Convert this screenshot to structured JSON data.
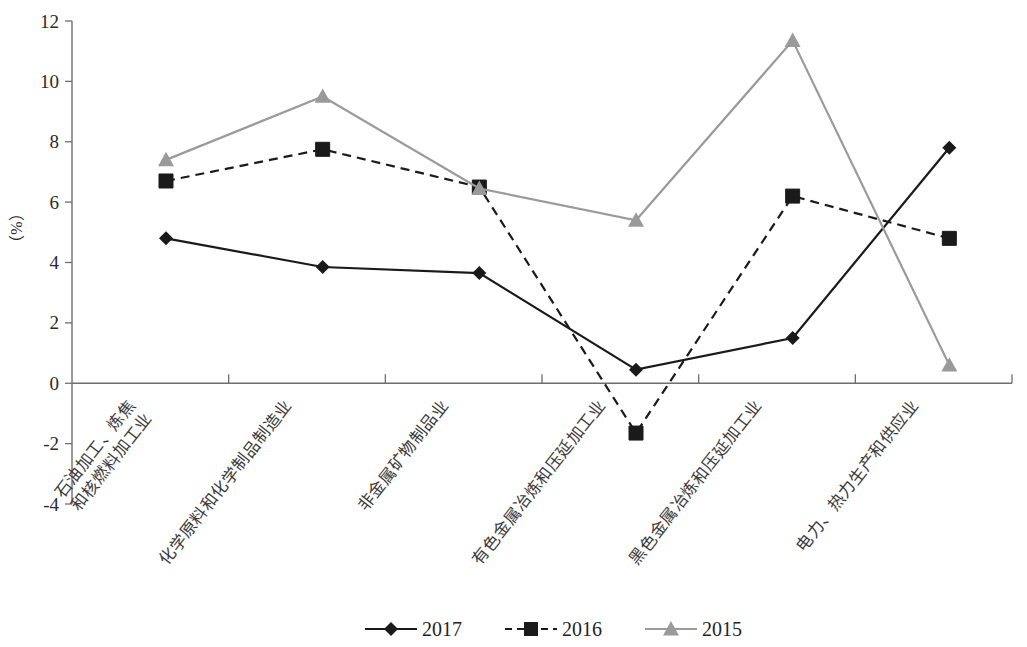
{
  "chart_data": {
    "type": "line",
    "title": "",
    "xlabel": "",
    "ylabel": "（%）",
    "ylim": [
      -4,
      12
    ],
    "ytick_step": 2,
    "yticks": [
      "12",
      "10",
      "8",
      "6",
      "4",
      "2",
      "0",
      "-2",
      "-4"
    ],
    "grid": false,
    "legend_position": "bottom",
    "categories": [
      "石油加工、炼焦\n和核燃料加工业",
      "化学原料和化学制品制造业",
      "非金属矿物制品业",
      "有色金属冶炼和压延加工业",
      "黑色金属冶炼和压延加工业",
      "电力、热力生产和供应业"
    ],
    "categories_lines": [
      [
        "石油加工、炼焦",
        "和核燃料加工业"
      ],
      [
        "化学原料和化学制品制造业"
      ],
      [
        "非金属矿物制品业"
      ],
      [
        "有色金属冶炼和压延加工业"
      ],
      [
        "黑色金属冶炼和压延加工业"
      ],
      [
        "电力、热力生产和供应业"
      ]
    ],
    "series": [
      {
        "name": "2017",
        "values": [
          4.8,
          3.85,
          3.65,
          0.45,
          1.5,
          7.8
        ],
        "color": "#1a1a1a",
        "linestyle": "solid",
        "marker": "diamond"
      },
      {
        "name": "2016",
        "values": [
          6.7,
          7.75,
          6.5,
          -1.65,
          6.2,
          4.8
        ],
        "color": "#1a1a1a",
        "linestyle": "dashed",
        "marker": "square"
      },
      {
        "name": "2015",
        "values": [
          7.4,
          9.5,
          6.45,
          5.4,
          11.35,
          0.6
        ],
        "color": "#9a9a9a",
        "linestyle": "solid",
        "marker": "triangle"
      }
    ]
  },
  "legend": {
    "items": [
      {
        "label": "2017"
      },
      {
        "label": "2016"
      },
      {
        "label": "2015"
      }
    ]
  },
  "axis": {
    "y_title": "（%）"
  }
}
